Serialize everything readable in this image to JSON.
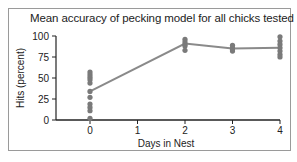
{
  "chart_data": {
    "type": "scatter",
    "title": "Mean accuracy of pecking model for all chicks tested",
    "xlabel": "Days in Nest",
    "ylabel": "Hits (percent)",
    "xlim": [
      -0.8,
      4
    ],
    "ylim": [
      0,
      100
    ],
    "x_ticks": [
      "0",
      "1",
      "2",
      "3",
      "4"
    ],
    "y_ticks": [
      "0",
      "25",
      "50",
      "75",
      "100"
    ],
    "grid": false,
    "legend": null,
    "series": [
      {
        "name": "Individual chicks",
        "type": "scatter",
        "points": [
          {
            "x": 0,
            "y": 57
          },
          {
            "x": 0,
            "y": 54
          },
          {
            "x": 0,
            "y": 51
          },
          {
            "x": 0,
            "y": 48
          },
          {
            "x": 0,
            "y": 44
          },
          {
            "x": 0,
            "y": 34
          },
          {
            "x": 0,
            "y": 27
          },
          {
            "x": 0,
            "y": 19
          },
          {
            "x": 0,
            "y": 15
          },
          {
            "x": 0,
            "y": 11
          },
          {
            "x": 0,
            "y": 2
          },
          {
            "x": 2,
            "y": 96
          },
          {
            "x": 2,
            "y": 93
          },
          {
            "x": 2,
            "y": 90
          },
          {
            "x": 2,
            "y": 88
          },
          {
            "x": 2,
            "y": 83
          },
          {
            "x": 3,
            "y": 89
          },
          {
            "x": 3,
            "y": 86
          },
          {
            "x": 3,
            "y": 84
          },
          {
            "x": 3,
            "y": 82
          },
          {
            "x": 4,
            "y": 99
          },
          {
            "x": 4,
            "y": 94
          },
          {
            "x": 4,
            "y": 90
          },
          {
            "x": 4,
            "y": 86
          },
          {
            "x": 4,
            "y": 82
          },
          {
            "x": 4,
            "y": 78
          },
          {
            "x": 4,
            "y": 75
          }
        ]
      },
      {
        "name": "Mean",
        "type": "line",
        "x": [
          0,
          2,
          3,
          4
        ],
        "y": [
          34,
          91,
          85,
          86
        ]
      }
    ],
    "colors": {
      "points": "#7a7a7a",
      "line": "#8a8a8a",
      "axis": "#222222",
      "frame": "#9a9a9a"
    }
  }
}
